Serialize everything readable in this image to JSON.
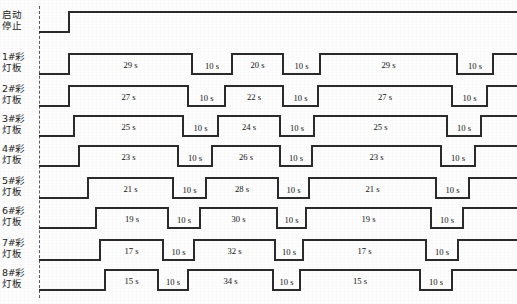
{
  "diagram": {
    "type": "timing-diagram",
    "title_visible": false,
    "width": 517,
    "height": 304,
    "time_origin_marker": "dashed-vertical-line",
    "rows": [
      {
        "label_line1": "启动",
        "label_line2": "停止",
        "name": "start-stop-signal",
        "segment_labels": [],
        "waveform": "low then high (single rising edge, stays high)"
      },
      {
        "label_line1": "1#彩",
        "label_line2": "灯板",
        "name": "lamp-board-1",
        "segment_labels": [
          "29 s",
          "10 s",
          "20 s",
          "10 s",
          "29 s",
          "10 s"
        ]
      },
      {
        "label_line1": "2#彩",
        "label_line2": "灯板",
        "name": "lamp-board-2",
        "segment_labels": [
          "27 s",
          "10 s",
          "22 s",
          "10 s",
          "27 s",
          "10 s"
        ]
      },
      {
        "label_line1": "3#彩",
        "label_line2": "灯板",
        "name": "lamp-board-3",
        "segment_labels": [
          "25 s",
          "10 s",
          "24 s",
          "10 s",
          "25 s",
          "10 s"
        ]
      },
      {
        "label_line1": "4#彩",
        "label_line2": "灯板",
        "name": "lamp-board-4",
        "segment_labels": [
          "23 s",
          "10 s",
          "26 s",
          "10 s",
          "23 s",
          "10 s"
        ]
      },
      {
        "label_line1": "5#彩",
        "label_line2": "灯板",
        "name": "lamp-board-5",
        "segment_labels": [
          "21 s",
          "10 s",
          "28 s",
          "10 s",
          "21 s",
          "10 s"
        ]
      },
      {
        "label_line1": "6#彩",
        "label_line2": "灯板",
        "name": "lamp-board-6",
        "segment_labels": [
          "19 s",
          "10 s",
          "30 s",
          "10 s",
          "19 s",
          "10 s"
        ]
      },
      {
        "label_line1": "7#彩",
        "label_line2": "灯板",
        "name": "lamp-board-7",
        "segment_labels": [
          "17 s",
          "10 s",
          "32 s",
          "10 s",
          "17 s",
          "10 s"
        ]
      },
      {
        "label_line1": "8#彩",
        "label_line2": "灯板",
        "name": "lamp-board-8",
        "segment_labels": [
          "15 s",
          "10 s",
          "34 s",
          "10 s",
          "15 s",
          "10 s"
        ]
      }
    ]
  },
  "chart_data": {
    "type": "line",
    "title": "",
    "xlabel": "",
    "ylabel": "",
    "grid": false,
    "legend_position": "none",
    "axis_note": "horizontal axis = time, vertical = 9 stacked digital signal traces",
    "series": [
      {
        "name": "启动/停止",
        "durations_s": [],
        "levels": [
          0,
          1
        ],
        "note": "low until start, then high for entire remaining time"
      },
      {
        "name": "1#彩灯板",
        "durations_s": [
          29,
          10,
          20,
          10,
          29,
          10
        ],
        "levels": [
          1,
          0,
          1,
          0,
          1,
          0,
          1
        ]
      },
      {
        "name": "2#彩灯板",
        "durations_s": [
          27,
          10,
          22,
          10,
          27,
          10
        ],
        "levels": [
          1,
          0,
          1,
          0,
          1,
          0,
          1
        ]
      },
      {
        "name": "3#彩灯板",
        "durations_s": [
          25,
          10,
          24,
          10,
          25,
          10
        ],
        "levels": [
          1,
          0,
          1,
          0,
          1,
          0,
          1
        ]
      },
      {
        "name": "4#彩灯板",
        "durations_s": [
          23,
          10,
          26,
          10,
          23,
          10
        ],
        "levels": [
          1,
          0,
          1,
          0,
          1,
          0,
          1
        ]
      },
      {
        "name": "5#彩灯板",
        "durations_s": [
          21,
          10,
          28,
          10,
          21,
          10
        ],
        "levels": [
          1,
          0,
          1,
          0,
          1,
          0,
          1
        ]
      },
      {
        "name": "6#彩灯板",
        "durations_s": [
          19,
          10,
          30,
          10,
          19,
          10
        ],
        "levels": [
          1,
          0,
          1,
          0,
          1,
          0,
          1
        ]
      },
      {
        "name": "7#彩灯板",
        "durations_s": [
          17,
          10,
          32,
          10,
          17,
          10
        ],
        "levels": [
          1,
          0,
          1,
          0,
          1,
          0,
          1
        ]
      },
      {
        "name": "8#彩灯板",
        "durations_s": [
          15,
          10,
          34,
          10,
          15,
          10
        ],
        "levels": [
          1,
          0,
          1,
          0,
          1,
          0,
          1
        ]
      }
    ]
  },
  "geometry": {
    "dash_line_x": 39,
    "row_tops": [
      8,
      50,
      82,
      112,
      142,
      174,
      204,
      236,
      266
    ],
    "row_height": 30,
    "traces": [
      {
        "rise": 69,
        "edges": [
          69
        ],
        "end": 517,
        "start_level": 0
      },
      {
        "rise": 69,
        "edges": [
          69,
          192,
          232,
          283,
          320,
          457,
          493
        ],
        "end": 517,
        "start_level": 0
      },
      {
        "rise": 69,
        "edges": [
          69,
          188,
          225,
          283,
          318,
          452,
          487
        ],
        "end": 517,
        "start_level": 0
      },
      {
        "rise": 74,
        "edges": [
          74,
          183,
          218,
          280,
          314,
          447,
          481
        ],
        "end": 517,
        "start_level": 0
      },
      {
        "rise": 79,
        "edges": [
          79,
          178,
          212,
          280,
          312,
          441,
          475
        ],
        "end": 517,
        "start_level": 0
      },
      {
        "rise": 88,
        "edges": [
          88,
          173,
          206,
          278,
          309,
          436,
          469
        ],
        "end": 517,
        "start_level": 0
      },
      {
        "rise": 96,
        "edges": [
          96,
          168,
          200,
          277,
          306,
          431,
          463
        ],
        "end": 517,
        "start_level": 0
      },
      {
        "rise": 100,
        "edges": [
          100,
          163,
          194,
          275,
          303,
          426,
          458
        ],
        "end": 517,
        "start_level": 0
      },
      {
        "rise": 105,
        "edges": [
          105,
          158,
          188,
          273,
          300,
          420,
          452
        ],
        "end": 517,
        "start_level": 0
      }
    ]
  }
}
